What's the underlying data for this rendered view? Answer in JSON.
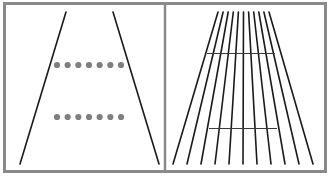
{
  "figure": {
    "panels": [
      {
        "name": "dots-panel",
        "description": "Two converging lines with two equal rows of dots",
        "converging_lines": 2,
        "dot_rows": [
          {
            "position": "upper",
            "dot_count": 7
          },
          {
            "position": "lower",
            "dot_count": 7
          }
        ]
      },
      {
        "name": "railway-panel",
        "description": "Fan of converging lines with two equal-length horizontal bars",
        "converging_lines": 11,
        "horizontal_bars": [
          {
            "position": "upper"
          },
          {
            "position": "lower"
          }
        ]
      }
    ]
  },
  "colors": {
    "background": "#ffffff",
    "frame": "#8a8a8a",
    "line": "#1a1a1a",
    "dot": "#7f7f7f",
    "bar": "#3a3a3a"
  }
}
